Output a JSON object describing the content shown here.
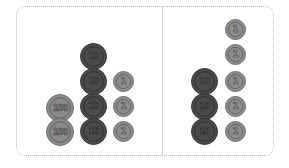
{
  "panels": [
    {
      "name": "left",
      "coins": [
        {
          "type": "c100",
          "label": "100",
          "x": 46,
          "y": 94
        },
        {
          "type": "c100",
          "label": "100",
          "x": 46,
          "y": 118
        },
        {
          "type": "c10",
          "label": "10",
          "x": 80,
          "y": 43
        },
        {
          "type": "c10",
          "label": "10",
          "x": 80,
          "y": 68
        },
        {
          "type": "c10",
          "label": "10",
          "x": 80,
          "y": 93
        },
        {
          "type": "c10",
          "label": "10",
          "x": 80,
          "y": 118
        },
        {
          "type": "c1",
          "label": "1",
          "x": 113,
          "y": 71
        },
        {
          "type": "c1",
          "label": "1",
          "x": 113,
          "y": 96
        },
        {
          "type": "c1",
          "label": "1",
          "x": 113,
          "y": 121
        }
      ]
    },
    {
      "name": "right",
      "coins": [
        {
          "type": "c10",
          "label": "10",
          "x": 191,
          "y": 68
        },
        {
          "type": "c10",
          "label": "10",
          "x": 191,
          "y": 93
        },
        {
          "type": "c10",
          "label": "10",
          "x": 191,
          "y": 118
        },
        {
          "type": "c1",
          "label": "1",
          "x": 225,
          "y": 19
        },
        {
          "type": "c1",
          "label": "1",
          "x": 225,
          "y": 44
        },
        {
          "type": "c1",
          "label": "1",
          "x": 225,
          "y": 71
        },
        {
          "type": "c1",
          "label": "1",
          "x": 225,
          "y": 96
        },
        {
          "type": "c1",
          "label": "1",
          "x": 225,
          "y": 121
        }
      ]
    }
  ],
  "summary": {
    "left": {
      "hundreds": 2,
      "tens": 4,
      "ones": 3,
      "value": 243
    },
    "right": {
      "hundreds": 0,
      "tens": 3,
      "ones": 5,
      "value": 35
    }
  },
  "colors": {
    "frame": "#b5b5b5",
    "coin100": "#8a8a8a",
    "coin10": "#4a4a4a",
    "coin1": "#8d8d8d"
  }
}
